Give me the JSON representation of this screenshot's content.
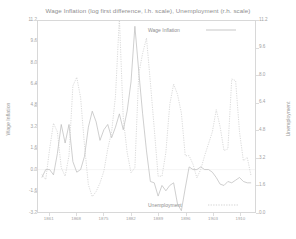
{
  "chart_data": {
    "type": "line",
    "title": "Wage Inflation (log first difference, l.h. scale), Unemployment (r.h. scale)",
    "xlabel": "",
    "ylabel": "Wage Inflation",
    "y2label": "Unemployment",
    "grid": false,
    "legend_position": "inside-top-right-and-bottom-right",
    "xlim": [
      1858,
      1914
    ],
    "xticks": [
      1861,
      1868,
      1875,
      1882,
      1889,
      1896,
      1903,
      1910
    ],
    "xticklabels": [
      "1861",
      "1868",
      "1875",
      "1882",
      "1889",
      "1896",
      "1903",
      "1910"
    ],
    "ylim": [
      -3.2,
      11.2
    ],
    "yticks": [
      -3.2,
      -1.6,
      0.0,
      1.6,
      3.2,
      4.8,
      6.4,
      8.0,
      9.6,
      11.2
    ],
    "yticklabels": [
      "-3.2",
      "-1.6",
      "0.0",
      "1.6",
      "3.2",
      "4.8",
      "6.4",
      "8.0",
      "9.6",
      "11.2"
    ],
    "y2lim": [
      0.0,
      11.2
    ],
    "y2ticks": [
      0.0,
      1.6,
      3.2,
      4.8,
      6.4,
      8.0,
      9.6,
      11.2
    ],
    "y2ticklabels": [
      "0.0",
      "1.6",
      "3.2",
      "4.8",
      "6.4",
      "8.0",
      "9.6",
      "11.2"
    ],
    "series": [
      {
        "name": "Wage Inflation",
        "axis": "left",
        "style": "solid",
        "color": "#b9b9b9",
        "x": [
          1859,
          1860,
          1861,
          1862,
          1863,
          1864,
          1865,
          1866,
          1867,
          1868,
          1869,
          1870,
          1871,
          1872,
          1873,
          1874,
          1875,
          1876,
          1877,
          1878,
          1879,
          1880,
          1881,
          1882,
          1883,
          1884,
          1885,
          1886,
          1887,
          1888,
          1889,
          1890,
          1891,
          1892,
          1893,
          1894,
          1895,
          1896,
          1897,
          1898,
          1899,
          1900,
          1901,
          1902,
          1903,
          1904,
          1905,
          1906,
          1907,
          1908,
          1909,
          1910,
          1911,
          1912,
          1913
        ],
        "y": [
          -0.6,
          0.0,
          0.0,
          -0.4,
          1.2,
          3.4,
          2.0,
          3.4,
          0.6,
          -0.2,
          0.0,
          1.0,
          3.2,
          4.4,
          3.6,
          2.2,
          3.0,
          3.4,
          2.4,
          3.2,
          4.2,
          3.0,
          4.4,
          6.6,
          10.8,
          7.4,
          4.2,
          1.4,
          -0.9,
          -1.0,
          -2.0,
          -1.2,
          -1.6,
          -1.2,
          -1.0,
          -2.6,
          -3.1,
          -1.4,
          0.2,
          0.0,
          0.0,
          0.2,
          0.0,
          0.0,
          -0.2,
          -0.6,
          -1.1,
          -1.2,
          -0.9,
          -1.0,
          -0.8,
          -0.6,
          -0.9,
          -1.0,
          -1.0
        ]
      },
      {
        "name": "Unemployment",
        "axis": "right",
        "style": "dotted",
        "color": "#c8c8c8",
        "x": [
          1859,
          1860,
          1861,
          1862,
          1863,
          1864,
          1865,
          1866,
          1867,
          1868,
          1869,
          1870,
          1871,
          1872,
          1873,
          1874,
          1875,
          1876,
          1877,
          1878,
          1879,
          1880,
          1881,
          1882,
          1883,
          1884,
          1885,
          1886,
          1887,
          1888,
          1889,
          1890,
          1891,
          1892,
          1893,
          1894,
          1895,
          1896,
          1897,
          1898,
          1899,
          1900,
          1901,
          1902,
          1903,
          1904,
          1905,
          1906,
          1907,
          1908,
          1909,
          1910,
          1911,
          1912,
          1913
        ],
        "y": [
          2.2,
          1.9,
          3.7,
          5.2,
          4.7,
          2.6,
          2.1,
          3.3,
          7.4,
          7.9,
          6.7,
          3.9,
          1.6,
          0.9,
          1.2,
          1.7,
          2.4,
          3.7,
          4.7,
          6.8,
          11.4,
          5.5,
          3.5,
          2.3,
          2.6,
          8.1,
          9.3,
          10.2,
          7.6,
          4.9,
          2.1,
          2.1,
          3.5,
          6.3,
          7.5,
          6.9,
          5.8,
          3.3,
          3.3,
          2.8,
          2.0,
          2.5,
          3.3,
          4.0,
          4.7,
          6.0,
          5.0,
          3.6,
          3.7,
          7.8,
          7.7,
          4.7,
          3.0,
          3.2,
          2.1
        ]
      }
    ]
  },
  "legends": {
    "wage_inflation": "Wage Inflation",
    "unemployment": "Unemployment"
  }
}
